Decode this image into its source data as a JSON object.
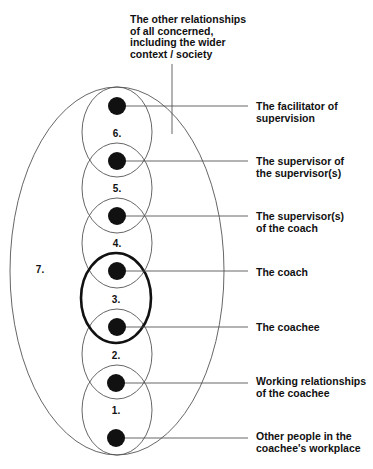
{
  "diagram": {
    "outer_label": "The other relationships\nof all concerned,\nincluding the wider\ncontext / society",
    "outer_number": "7.",
    "zone_numbers": [
      "6.",
      "5.",
      "4.",
      "3.",
      "2.",
      "1."
    ],
    "nodes": [
      {
        "id": "facilitator",
        "label": "The facilitator of\nsupervision"
      },
      {
        "id": "supervisor-of-supervisor",
        "label": "The supervisor of\nthe supervisor(s)"
      },
      {
        "id": "supervisor-of-coach",
        "label": "The supervisor(s)\nof the coach"
      },
      {
        "id": "coach",
        "label": "The coach"
      },
      {
        "id": "coachee",
        "label": "The coachee"
      },
      {
        "id": "working-relationships",
        "label": "Working relationships\nof the coachee"
      },
      {
        "id": "other-people",
        "label": "Other people in the\ncoachee's workplace"
      }
    ],
    "colors": {
      "stroke": "#555555",
      "bold_stroke": "#111111",
      "dot": "#111111"
    }
  }
}
